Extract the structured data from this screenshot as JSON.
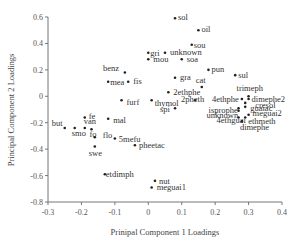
{
  "chart_data": {
    "type": "scatter",
    "title": "",
    "xlabel": "Prinipal Component 1 Loadings",
    "ylabel": "Principal Component 2 Loadings",
    "xlim": [
      -0.3,
      0.4
    ],
    "ylim": [
      -0.8,
      0.6
    ],
    "xticks": [
      -0.3,
      -0.2,
      -0.1,
      0,
      0.1,
      0.2,
      0.3,
      0.4
    ],
    "xtick_labels": [
      "-0.3",
      "-0.2",
      "-0.1",
      "0",
      "0.1",
      "0.2",
      "0.3",
      "0.4"
    ],
    "yticks": [
      0.6,
      0.4,
      0.2,
      0,
      -0.2,
      -0.4,
      -0.6,
      -0.8
    ],
    "ytick_labels": [
      "0.6",
      "0.4",
      "0.2",
      "0",
      "-0.2",
      "-0.4",
      "-0.6",
      "-0.8"
    ],
    "grid": false,
    "legend": null,
    "points": [
      {
        "label": "sol",
        "x": 0.08,
        "y": 0.59,
        "lx": 3,
        "ly": 2
      },
      {
        "label": "oil",
        "x": 0.15,
        "y": 0.5,
        "lx": 3,
        "ly": 2
      },
      {
        "label": "sou",
        "x": 0.13,
        "y": 0.39,
        "lx": 2,
        "ly": 0
      },
      {
        "label": "gri",
        "x": 0.0,
        "y": 0.33,
        "lx": 2,
        "ly": 0
      },
      {
        "label": "unknown",
        "x": 0.05,
        "y": 0.33,
        "lx": 5,
        "ly": 2
      },
      {
        "label": "mou",
        "x": 0.0,
        "y": 0.28,
        "lx": 5,
        "ly": 3
      },
      {
        "label": "soa",
        "x": 0.1,
        "y": 0.28,
        "lx": 5,
        "ly": 3
      },
      {
        "label": "benz",
        "x": -0.07,
        "y": 0.18,
        "lx": -22,
        "ly": -2
      },
      {
        "label": "mea",
        "x": -0.12,
        "y": 0.11,
        "lx": 2,
        "ly": 3
      },
      {
        "label": "fis",
        "x": -0.06,
        "y": 0.11,
        "lx": 5,
        "ly": 2
      },
      {
        "label": "gra",
        "x": 0.08,
        "y": 0.14,
        "lx": 5,
        "ly": 2
      },
      {
        "label": "pun",
        "x": 0.18,
        "y": 0.2,
        "lx": 3,
        "ly": 2
      },
      {
        "label": "sul",
        "x": 0.26,
        "y": 0.16,
        "lx": 3,
        "ly": 3
      },
      {
        "label": "cat",
        "x": 0.16,
        "y": 0.07,
        "lx": -6,
        "ly": -4
      },
      {
        "label": "2ethphe",
        "x": 0.06,
        "y": 0.03,
        "lx": 5,
        "ly": 3
      },
      {
        "label": "furf",
        "x": -0.08,
        "y": -0.03,
        "lx": 5,
        "ly": 5
      },
      {
        "label": "thymol",
        "x": 0.01,
        "y": -0.03,
        "lx": 3,
        "ly": 6
      },
      {
        "label": "2pheth",
        "x": 0.14,
        "y": -0.03,
        "lx": -14,
        "ly": 2
      },
      {
        "label": "spi",
        "x": 0.08,
        "y": -0.09,
        "lx": -15,
        "ly": 4
      },
      {
        "label": "fe",
        "x": -0.19,
        "y": -0.16,
        "lx": 4,
        "ly": 2
      },
      {
        "label": "mal",
        "x": -0.12,
        "y": -0.17,
        "lx": 5,
        "ly": 4
      },
      {
        "label": "but",
        "x": -0.25,
        "y": -0.24,
        "lx": -13,
        "ly": -2
      },
      {
        "label": "smo",
        "x": -0.22,
        "y": -0.24,
        "lx": -3,
        "ly": 8
      },
      {
        "label": "van",
        "x": -0.19,
        "y": -0.24,
        "lx": -1,
        "ly": -4
      },
      {
        "label": "fo",
        "x": -0.17,
        "y": -0.25,
        "lx": -2,
        "ly": 8
      },
      {
        "label": "flo",
        "x": -0.16,
        "y": -0.31,
        "lx": 8,
        "ly": 1
      },
      {
        "label": "swe",
        "x": -0.16,
        "y": -0.38,
        "lx": -6,
        "ly": 9
      },
      {
        "label": "5mefu",
        "x": -0.1,
        "y": -0.32,
        "lx": 4,
        "ly": 3
      },
      {
        "label": "pheetac",
        "x": -0.04,
        "y": -0.37,
        "lx": 4,
        "ly": 3
      },
      {
        "label": "etdimph",
        "x": -0.13,
        "y": -0.59,
        "lx": 1,
        "ly": 3
      },
      {
        "label": "nut",
        "x": 0.02,
        "y": -0.64,
        "lx": 4,
        "ly": 3
      },
      {
        "label": "meguai1",
        "x": 0.01,
        "y": -0.69,
        "lx": 5,
        "ly": 3
      },
      {
        "label": "trimeph",
        "x": 0.3,
        "y": 0.0,
        "lx": -12,
        "ly": -5
      },
      {
        "label": "4ethphe",
        "x": 0.28,
        "y": -0.02,
        "lx": -30,
        "ly": 3
      },
      {
        "label": "dimephe2",
        "x": 0.3,
        "y": -0.02,
        "lx": 3,
        "ly": 0
      },
      {
        "label": "cresol",
        "x": 0.29,
        "y": -0.05,
        "lx": 10,
        "ly": 5
      },
      {
        "label": "isprophe",
        "x": 0.27,
        "y": -0.09,
        "lx": -30,
        "ly": 5
      },
      {
        "label": "guaiac",
        "x": 0.29,
        "y": -0.08,
        "lx": 5,
        "ly": 4
      },
      {
        "label": "unknown",
        "x": 0.27,
        "y": -0.11,
        "lx": -32,
        "ly": 7
      },
      {
        "label": "meguai2",
        "x": 0.3,
        "y": -0.14,
        "lx": 4,
        "ly": 1
      },
      {
        "label": "4ethguai",
        "x": 0.27,
        "y": -0.16,
        "lx": -22,
        "ly": 6
      },
      {
        "label": "ethmeth",
        "x": 0.29,
        "y": -0.16,
        "lx": 3,
        "ly": 7
      },
      {
        "label": "dimephe",
        "x": 0.28,
        "y": -0.19,
        "lx": -2,
        "ly": 9
      }
    ]
  },
  "colors": {
    "point": "#222222",
    "axis": "#777777",
    "text": "#333333",
    "background": "#ffffff"
  }
}
